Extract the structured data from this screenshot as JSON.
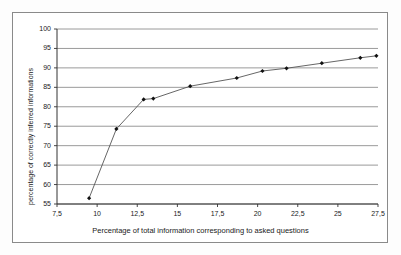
{
  "chart_data": {
    "type": "line",
    "title": "",
    "xlabel": "Percentage of total information corresponding to asked questions",
    "ylabel": "percentage of correctly inferred informations",
    "xlim": [
      7.5,
      27.5
    ],
    "ylim": [
      55,
      100
    ],
    "grid": "horizontal",
    "legend": "none",
    "marker": "diamond",
    "line_color": "#555555",
    "marker_color": "#111111",
    "grid_color": "#808080",
    "axis_color": "#333333",
    "xticks": [
      "7,5",
      "10",
      "12,5",
      "15",
      "17,5",
      "20",
      "22,5",
      "25",
      "27,5"
    ],
    "xtick_values": [
      7.5,
      10,
      12.5,
      15,
      17.5,
      20,
      22.5,
      25,
      27.5
    ],
    "yticks": [
      "55",
      "60",
      "65",
      "70",
      "75",
      "80",
      "85",
      "90",
      "95",
      "100"
    ],
    "ytick_values": [
      55,
      60,
      65,
      70,
      75,
      80,
      85,
      90,
      95,
      100
    ],
    "x": [
      9.5,
      11.2,
      12.9,
      13.5,
      15.8,
      18.7,
      20.3,
      21.8,
      24.0,
      26.4,
      27.4
    ],
    "values": [
      56.5,
      74.3,
      81.9,
      82.1,
      85.3,
      87.4,
      89.2,
      89.9,
      91.2,
      92.6,
      93.1
    ],
    "series": [
      {
        "name": "percentage of correctly inferred informations",
        "points": [
          {
            "x": 9.5,
            "y": 56.5
          },
          {
            "x": 11.2,
            "y": 74.3
          },
          {
            "x": 12.9,
            "y": 81.9
          },
          {
            "x": 13.5,
            "y": 82.1
          },
          {
            "x": 15.8,
            "y": 85.3
          },
          {
            "x": 18.7,
            "y": 87.4
          },
          {
            "x": 20.3,
            "y": 89.2
          },
          {
            "x": 21.8,
            "y": 89.9
          },
          {
            "x": 24.0,
            "y": 91.2
          },
          {
            "x": 26.4,
            "y": 92.6
          },
          {
            "x": 27.4,
            "y": 93.1
          }
        ]
      }
    ]
  }
}
